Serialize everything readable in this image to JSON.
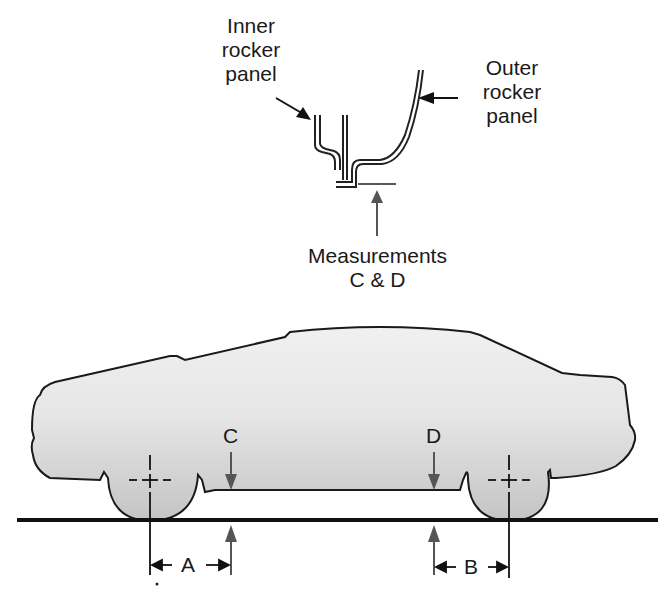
{
  "diagram": {
    "labels": {
      "inner_rocker": [
        "Inner",
        "rocker",
        "panel"
      ],
      "outer_rocker": [
        "Outer",
        "rocker",
        "panel"
      ],
      "measurements": [
        "Measurements",
        "C & D"
      ],
      "C": "C",
      "D": "D",
      "A": "A",
      "B": "B"
    },
    "colors": {
      "line": "#1a1a1a",
      "car_fill_top": "#f2f2f2",
      "car_fill_bottom": "#c8c8c8",
      "arrow": "#555555"
    }
  }
}
